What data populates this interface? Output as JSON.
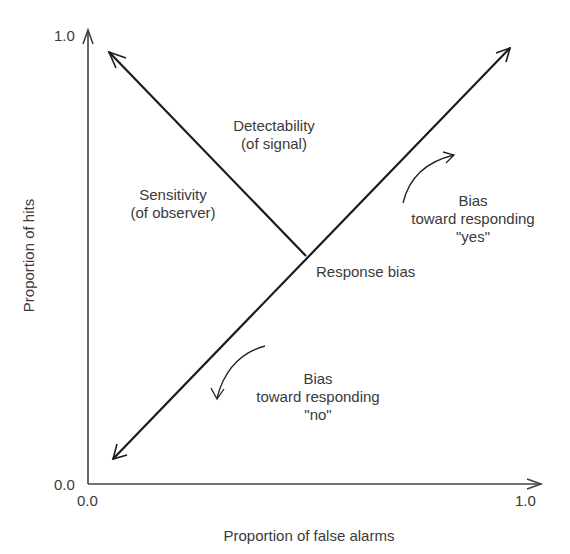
{
  "diagram": {
    "axes": {
      "x_label": "Proportion of false alarms",
      "y_label": "Proportion of hits",
      "x_ticks": [
        "0.0",
        "1.0"
      ],
      "y_ticks": [
        "0.0",
        "1.0"
      ]
    },
    "labels": {
      "detectability_line1": "Detectability",
      "detectability_line2": "(of signal)",
      "sensitivity_line1": "Sensitivity",
      "sensitivity_line2": "(of observer)",
      "response_bias": "Response bias",
      "bias_yes_line1": "Bias",
      "bias_yes_line2": "toward responding",
      "bias_yes_line3": "\"yes\"",
      "bias_no_line1": "Bias",
      "bias_no_line2": "toward responding",
      "bias_no_line3": "\"no\""
    },
    "colors": {
      "line": "#1a1a1a",
      "axis": "#444444",
      "text": "#3a3a3a"
    }
  }
}
